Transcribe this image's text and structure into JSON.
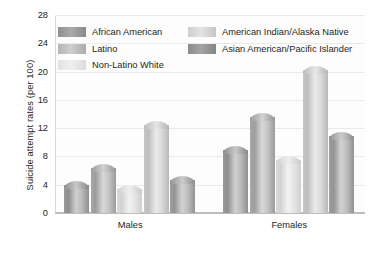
{
  "chart_data": {
    "type": "bar",
    "title": "",
    "xlabel": "",
    "ylabel": "Suicide attempt rates (per 100)",
    "categories": [
      "Males",
      "Females"
    ],
    "ylim": [
      0,
      28
    ],
    "yticks": [
      0,
      4,
      8,
      12,
      16,
      20,
      24,
      28
    ],
    "grid": true,
    "legend_position": "top-inside",
    "series": [
      {
        "name": "African American",
        "values": [
          4.5,
          9.5
        ],
        "color": "#9a9a9a"
      },
      {
        "name": "Latino",
        "values": [
          7.0,
          14.2
        ],
        "color": "#a8a8a8"
      },
      {
        "name": "Non-Latino White",
        "values": [
          4.0,
          8.0
        ],
        "color": "#e6e6e6"
      },
      {
        "name": "American Indian/Alaska Native",
        "values": [
          13.0,
          20.8
        ],
        "color": "#d2d2d2"
      },
      {
        "name": "Asian American/Pacific Islander",
        "values": [
          5.2,
          11.5
        ],
        "color": "#9f9f9f"
      }
    ]
  },
  "legend": {
    "items": [
      {
        "label": "African American"
      },
      {
        "label": "Latino"
      },
      {
        "label": "Non-Latino White"
      },
      {
        "label": "American Indian/Alaska Native"
      },
      {
        "label": "Asian American/Pacific Islander"
      }
    ]
  },
  "axis": {
    "y_title": "Suicide attempt rates (per 100)",
    "y_tick_labels": [
      "28",
      "24",
      "20",
      "16",
      "12",
      "8",
      "4",
      "0"
    ],
    "x_tick_labels": [
      "Males",
      "Females"
    ]
  }
}
